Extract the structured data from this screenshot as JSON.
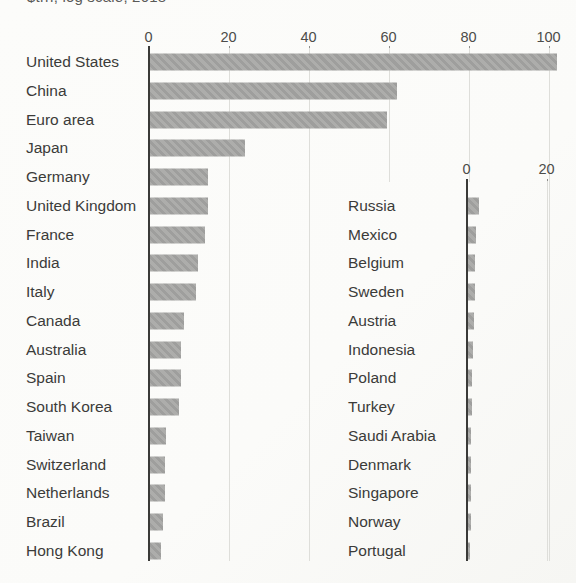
{
  "caption_clipped": "$trn, log scale, 2018",
  "colors": {
    "bar": "#a7a7a5",
    "axis": "#3a3a38",
    "gridline": "#dededa",
    "country_label": "#3b3b39",
    "tick_label": "#4c4c4a",
    "background": "#fbfbf9"
  },
  "chart_data": [
    {
      "id": "main",
      "type": "bar",
      "orientation": "horizontal",
      "axis_position": "top",
      "grid": true,
      "legend": "none",
      "ticks": [
        0,
        20,
        40,
        60,
        80,
        100
      ],
      "xlim": [
        0,
        102
      ],
      "categories": [
        "United States",
        "China",
        "Euro area",
        "Japan",
        "Germany",
        "United Kingdom",
        "France",
        "India",
        "Italy",
        "Canada",
        "Australia",
        "Spain",
        "South Korea",
        "Taiwan",
        "Switzerland",
        "Netherlands",
        "Brazil",
        "Hong Kong"
      ],
      "values": [
        102,
        62,
        59.5,
        24,
        14.8,
        14.8,
        14.2,
        12.4,
        11.8,
        8.8,
        8.0,
        8.0,
        7.5,
        4.4,
        4.0,
        4.1,
        3.5,
        3.2
      ]
    },
    {
      "id": "inset",
      "type": "bar",
      "orientation": "horizontal",
      "axis_position": "top",
      "grid": true,
      "legend": "none",
      "ticks": [
        0,
        20
      ],
      "xlim": [
        0,
        20
      ],
      "categories": [
        "Russia",
        "Mexico",
        "Belgium",
        "Sweden",
        "Austria",
        "Indonesia",
        "Poland",
        "Turkey",
        "Saudi Arabia",
        "Denmark",
        "Singapore",
        "Norway",
        "Portugal"
      ],
      "values": [
        3.0,
        2.4,
        2.2,
        2.0,
        1.8,
        1.6,
        1.4,
        1.3,
        1.2,
        1.1,
        1.1,
        1.0,
        0.9
      ]
    }
  ]
}
